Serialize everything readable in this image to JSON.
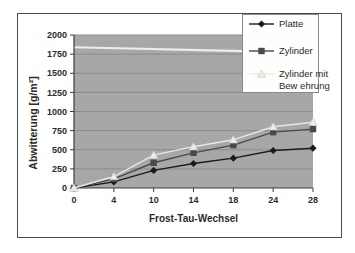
{
  "page": {
    "background_color": "#ffffff",
    "frame_border_color": "#4b4b4b"
  },
  "chart_data": {
    "type": "line",
    "title": "",
    "xlabel": "Frost-Tau-Wechsel",
    "ylabel": "Abwitterung [g/m²]",
    "x_axis_type": "category",
    "categories": [
      "0",
      "4",
      "10",
      "14",
      "18",
      "24",
      "28"
    ],
    "y_ticks": [
      0,
      250,
      500,
      750,
      1000,
      1250,
      1500,
      1750,
      2000
    ],
    "ylim": [
      0,
      2000
    ],
    "grid": "horizontal-major",
    "legend_position": "top-right-overlay",
    "plot_bg_color": "#a7a7a7",
    "gridline_color": "#8b8b8b",
    "axis_color": "#3c3c3c",
    "text_color": "#2b2b2b",
    "series": [
      {
        "name": "Platte",
        "marker": "diamond",
        "color": "#1b1b1b",
        "values": [
          0,
          80,
          230,
          320,
          390,
          490,
          520
        ]
      },
      {
        "name": "Zylinder",
        "marker": "square",
        "color": "#4a4a4a",
        "values": [
          0,
          120,
          330,
          460,
          560,
          730,
          770
        ]
      },
      {
        "name": "Zylinder mit Bew ehrung",
        "legend_lines": [
          "Zylinder mit",
          "Bew ehrung"
        ],
        "marker": "triangle",
        "color": "#e9e7e0",
        "marker_fill": "#edece6",
        "marker_stroke": "#c8c5be",
        "values": [
          0,
          150,
          430,
          540,
          630,
          800,
          860
        ]
      }
    ],
    "scan_artifact": {
      "description": "light horizontal scan streak",
      "color": "#f3f1eb",
      "y_value_left": 1840,
      "y_value_right": 1790
    }
  }
}
